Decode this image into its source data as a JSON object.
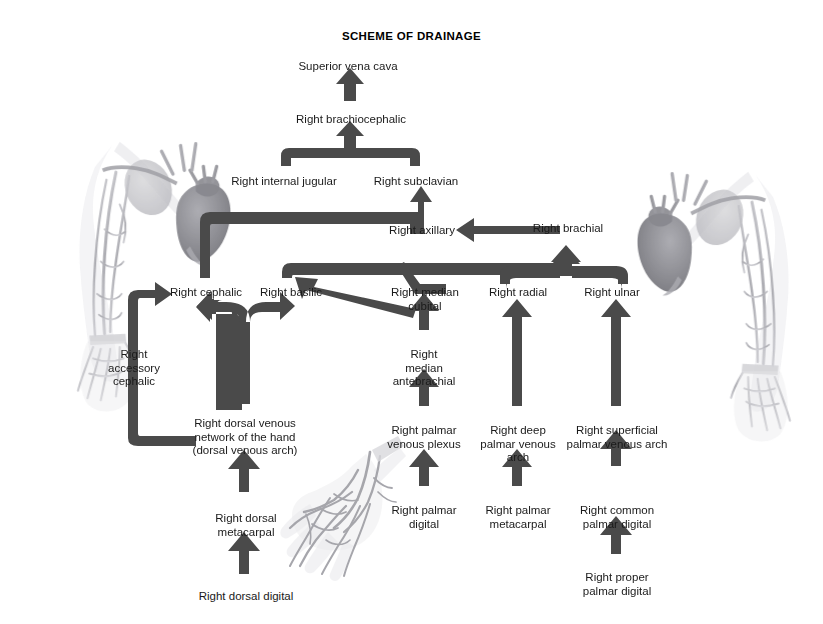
{
  "title": "SCHEME OF DRAINAGE",
  "colors": {
    "arrow": "#4a4a4a",
    "text": "#1a1a1a",
    "background": "#ffffff",
    "artwork": "#8d8d93"
  },
  "nodes": [
    {
      "id": "superior-vena-cava",
      "label": "Superior vena cava",
      "x": 348,
      "y": 60
    },
    {
      "id": "right-brachiocephalic",
      "label": "Right brachiocephalic",
      "x": 351,
      "y": 113
    },
    {
      "id": "right-internal-jugular",
      "label": "Right internal jugular",
      "x": 284,
      "y": 175
    },
    {
      "id": "right-subclavian",
      "label": "Right subclavian",
      "x": 416,
      "y": 175
    },
    {
      "id": "right-axillary",
      "label": "Right axillary",
      "x": 422,
      "y": 230
    },
    {
      "id": "right-brachial",
      "label": "Right brachial",
      "x": 568,
      "y": 228
    },
    {
      "id": "right-cephalic",
      "label": "Right cephalic",
      "x": 206,
      "y": 288
    },
    {
      "id": "right-basilic",
      "label": "Right basilic",
      "x": 291,
      "y": 288
    },
    {
      "id": "right-median-cubital",
      "label": "Right median\ncubital",
      "x": 425,
      "y": 288
    },
    {
      "id": "right-radial",
      "label": "Right radial",
      "x": 518,
      "y": 288
    },
    {
      "id": "right-ulnar",
      "label": "Right ulnar",
      "x": 612,
      "y": 288
    },
    {
      "id": "right-accessory-cephalic",
      "label": "Right\naccessory\ncephalic",
      "x": 134,
      "y": 350
    },
    {
      "id": "right-median-antebrachial",
      "label": "Right\nmedian\nantebrachial",
      "x": 424,
      "y": 350
    },
    {
      "id": "right-dorsal-venous-network",
      "label": "Right dorsal venous\nnetwork of the hand\n(dorsal venous arch)",
      "x": 245,
      "y": 419
    },
    {
      "id": "right-palmar-venous-plexus",
      "label": "Right palmar\nvenous plexus",
      "x": 424,
      "y": 426
    },
    {
      "id": "right-deep-palmar-venous-arch",
      "label": "Right deep\npalmar venous\narch",
      "x": 518,
      "y": 426
    },
    {
      "id": "right-superficial-palmar-venous-arch",
      "label": "Right superficial\npalmar venous arch",
      "x": 617,
      "y": 426
    },
    {
      "id": "right-dorsal-metacarpal",
      "label": "Right dorsal\nmetacarpal",
      "x": 246,
      "y": 514
    },
    {
      "id": "right-palmar-digital",
      "label": "Right palmar\ndigital",
      "x": 424,
      "y": 506
    },
    {
      "id": "right-palmar-metacarpal",
      "label": "Right palmar\nmetacarpal",
      "x": 518,
      "y": 506
    },
    {
      "id": "right-common-palmar-digital",
      "label": "Right common\npalmar digital",
      "x": 617,
      "y": 506
    },
    {
      "id": "right-dorsal-digital",
      "label": "Right dorsal digital",
      "x": 246,
      "y": 592
    },
    {
      "id": "right-proper-palmar-digital",
      "label": "Right proper\npalmar digital",
      "x": 617,
      "y": 573
    }
  ],
  "flows": [
    {
      "from": "right-brachiocephalic",
      "to": "superior-vena-cava"
    },
    {
      "from": "right-internal-jugular-and-subclavian",
      "to": "right-brachiocephalic"
    },
    {
      "from": "right-axillary",
      "to": "right-subclavian"
    },
    {
      "from": "right-brachial",
      "to": "right-axillary"
    },
    {
      "from": "right-cephalic",
      "to": "right-subclavian"
    },
    {
      "from": "right-basilic",
      "to": "right-axillary"
    },
    {
      "from": "right-radial-and-ulnar",
      "to": "right-brachial"
    },
    {
      "from": "right-median-cubital",
      "to": "right-basilic"
    },
    {
      "from": "right-accessory-cephalic",
      "to": "right-cephalic"
    },
    {
      "from": "right-dorsal-venous-network",
      "to": "right-cephalic-and-basilic"
    },
    {
      "from": "right-dorsal-venous-network",
      "to": "right-accessory-cephalic"
    },
    {
      "from": "right-median-antebrachial",
      "to": "right-median-cubital"
    },
    {
      "from": "right-palmar-venous-plexus",
      "to": "right-median-antebrachial"
    },
    {
      "from": "right-deep-palmar-venous-arch",
      "to": "right-radial"
    },
    {
      "from": "right-superficial-palmar-venous-arch",
      "to": "right-ulnar"
    },
    {
      "from": "right-dorsal-metacarpal",
      "to": "right-dorsal-venous-network"
    },
    {
      "from": "right-dorsal-digital",
      "to": "right-dorsal-metacarpal"
    },
    {
      "from": "right-palmar-digital",
      "to": "right-palmar-venous-plexus"
    },
    {
      "from": "right-palmar-metacarpal",
      "to": "right-deep-palmar-venous-arch"
    },
    {
      "from": "right-common-palmar-digital",
      "to": "right-superficial-palmar-venous-arch"
    },
    {
      "from": "right-proper-palmar-digital",
      "to": "right-common-palmar-digital"
    }
  ],
  "artwork": [
    {
      "id": "left-arm-veins-illustration",
      "description": "Right upper limb venous anatomy with heart, left side"
    },
    {
      "id": "right-arm-veins-illustration",
      "description": "Right upper limb venous anatomy with heart, right side"
    },
    {
      "id": "dorsal-hand-veins-illustration",
      "description": "Dorsal venous network of the hand"
    }
  ]
}
